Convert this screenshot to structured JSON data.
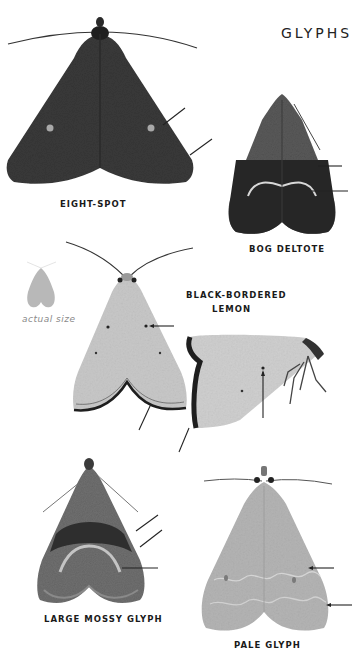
{
  "page": {
    "title": "GLYPHS",
    "actual_size_caption": "actual size"
  },
  "species": [
    {
      "name": "EIGHT-SPOT",
      "view": "dorsal",
      "pointer_count": 2
    },
    {
      "name": "BOG DELTOTE",
      "view": "dorsal",
      "pointer_count": 2
    },
    {
      "name_line1": "BLACK-BORDERED",
      "name_line2": "LEMON",
      "views": [
        "dorsal",
        "lateral"
      ],
      "pointer_count": 4
    },
    {
      "name": "LARGE MOSSY GLYPH",
      "view": "dorsal",
      "pointer_count": 3
    },
    {
      "name": "PALE GLYPH",
      "view": "dorsal",
      "pointer_count": 2
    }
  ],
  "colors": {
    "background": "#ffffff",
    "label_text": "#1a1a1a",
    "caption_text": "#8a8a8a",
    "pointer_line": "#222222",
    "eight_spot_wing": "#3a3a3a",
    "bog_deltote_wing": "#555555",
    "lemon_wing": "#c8c8c8",
    "mossy_wing": "#6a6a6a",
    "pale_glyph_wing": "#b0b0b0",
    "actual_size_silhouette": "#b8b8b8"
  }
}
